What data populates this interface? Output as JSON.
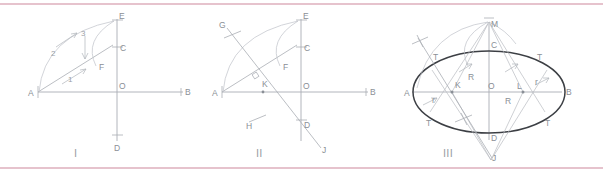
{
  "figure": {
    "background_color": "#ffffff",
    "rule_color": "#e6c3cd",
    "construction_line_color": "#b9bcc2",
    "ellipse_color": "#3c3f44",
    "label_color": "#8a8f96",
    "panel_count": 3
  },
  "panels": [
    {
      "id": "panel-1",
      "numeral": "I",
      "points": [
        {
          "key": "A",
          "label": "A"
        },
        {
          "key": "B",
          "label": "B"
        },
        {
          "key": "C",
          "label": "C"
        },
        {
          "key": "D",
          "label": "D"
        },
        {
          "key": "E",
          "label": "E"
        },
        {
          "key": "F",
          "label": "F"
        },
        {
          "key": "O",
          "label": "O"
        }
      ],
      "step_labels": [
        {
          "key": "1",
          "label": "1"
        },
        {
          "key": "2",
          "label": "2"
        },
        {
          "key": "3",
          "label": "3"
        }
      ]
    },
    {
      "id": "panel-2",
      "numeral": "II",
      "points": [
        {
          "key": "A",
          "label": "A"
        },
        {
          "key": "B",
          "label": "B"
        },
        {
          "key": "C",
          "label": "C"
        },
        {
          "key": "D",
          "label": "D"
        },
        {
          "key": "E",
          "label": "E"
        },
        {
          "key": "F",
          "label": "F"
        },
        {
          "key": "G",
          "label": "G"
        },
        {
          "key": "H",
          "label": "H"
        },
        {
          "key": "J",
          "label": "J"
        },
        {
          "key": "K",
          "label": "K"
        },
        {
          "key": "O",
          "label": "O"
        }
      ],
      "step_labels": []
    },
    {
      "id": "panel-3",
      "numeral": "III",
      "points": [
        {
          "key": "A",
          "label": "A"
        },
        {
          "key": "B",
          "label": "B"
        },
        {
          "key": "C",
          "label": "C"
        },
        {
          "key": "D",
          "label": "D"
        },
        {
          "key": "J",
          "label": "J"
        },
        {
          "key": "K",
          "label": "K"
        },
        {
          "key": "L",
          "label": "L"
        },
        {
          "key": "M",
          "label": "M"
        },
        {
          "key": "O",
          "label": "O"
        }
      ],
      "radius_labels": [
        {
          "key": "R-left",
          "label": "R"
        },
        {
          "key": "R-right",
          "label": "R"
        },
        {
          "key": "r-left",
          "label": "r"
        },
        {
          "key": "r-right",
          "label": "r"
        }
      ],
      "tangent_labels": [
        {
          "key": "T-upper-left",
          "label": "T"
        },
        {
          "key": "T-lower-left",
          "label": "T"
        },
        {
          "key": "T-upper-right",
          "label": "T"
        },
        {
          "key": "T-lower-right",
          "label": "T"
        }
      ]
    }
  ]
}
